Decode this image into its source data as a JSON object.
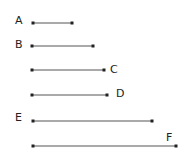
{
  "diagram": {
    "type": "line-segment-comparison",
    "segments": [
      {
        "label": "A",
        "x1": 33,
        "x2": 72,
        "y": 23,
        "label_x": 15,
        "label_y": 24
      },
      {
        "label": "B",
        "x1": 32,
        "x2": 93,
        "y": 46,
        "label_x": 15,
        "label_y": 48
      },
      {
        "label": "C",
        "x1": 32,
        "x2": 104,
        "y": 70,
        "label_x": 110,
        "label_y": 73
      },
      {
        "label": "D",
        "x1": 32,
        "x2": 107,
        "y": 95,
        "label_x": 116,
        "label_y": 97
      },
      {
        "label": "E",
        "x1": 33,
        "x2": 152,
        "y": 121,
        "label_x": 15,
        "label_y": 121
      },
      {
        "label": "F",
        "x1": 33,
        "x2": 176,
        "y": 146,
        "label_x": 166,
        "label_y": 141
      }
    ],
    "colors": {
      "line": "#555555",
      "endpoint": "#222222",
      "label": "#222222"
    }
  }
}
